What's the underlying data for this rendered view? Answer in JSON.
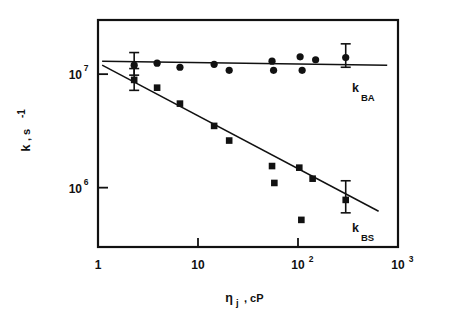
{
  "chart_data": {
    "type": "scatter",
    "title": "",
    "subtitle": "",
    "xlabel": "ηⱼ , cP",
    "xlabel_symbol": "η",
    "xlabel_sub": "j",
    "xlabel_unit": ", cP",
    "ylabel": "k , s  -1",
    "ylabel_symbol": "k",
    "ylabel_unit": ", s",
    "ylabel_exponent": "-1",
    "xscale": "log",
    "yscale": "log",
    "xlim": [
      1,
      1000
    ],
    "ylim": [
      300000,
      30000000
    ],
    "grid": false,
    "legend_position": "inline-right",
    "xticks": [
      {
        "value": 1,
        "label": "1",
        "mantissa": "1",
        "exponent": ""
      },
      {
        "value": 10,
        "label": "10",
        "mantissa": "10",
        "exponent": ""
      },
      {
        "value": 100,
        "label": "10²",
        "mantissa": "10",
        "exponent": "2"
      },
      {
        "value": 1000,
        "label": "10³",
        "mantissa": "10",
        "exponent": "3"
      }
    ],
    "yticks": [
      {
        "value": 10000000,
        "label": "10⁷",
        "mantissa": "10",
        "exponent": "7"
      },
      {
        "value": 1000000,
        "label": "10⁶",
        "mantissa": "10",
        "exponent": "6"
      }
    ],
    "series": [
      {
        "name": "k_BA",
        "label_symbol": "k",
        "label_sub": "BA",
        "marker": "circle",
        "color": "#111111",
        "points": [
          {
            "x": 2.3,
            "y": 12000000
          },
          {
            "x": 3.9,
            "y": 12500000
          },
          {
            "x": 6.6,
            "y": 11500000
          },
          {
            "x": 14.5,
            "y": 12200000
          },
          {
            "x": 20.5,
            "y": 10800000
          },
          {
            "x": 55,
            "y": 13000000
          },
          {
            "x": 57,
            "y": 10800000
          },
          {
            "x": 105,
            "y": 14200000
          },
          {
            "x": 110,
            "y": 10800000
          },
          {
            "x": 150,
            "y": 13400000
          },
          {
            "x": 300,
            "y": 14000000
          }
        ],
        "errorbars": [
          {
            "x": 2.3,
            "y": 12000000,
            "low": 9800000,
            "high": 15500000
          },
          {
            "x": 300,
            "y": 14000000,
            "low": 11500000,
            "high": 18500000
          }
        ],
        "fit": {
          "x1": 1.1,
          "y1": 13000000,
          "x2": 780,
          "y2": 12000000
        }
      },
      {
        "name": "k_BS",
        "label_symbol": "k",
        "label_sub": "BS",
        "marker": "square",
        "color": "#111111",
        "points": [
          {
            "x": 2.3,
            "y": 8900000
          },
          {
            "x": 3.9,
            "y": 7600000
          },
          {
            "x": 6.6,
            "y": 5500000
          },
          {
            "x": 14.5,
            "y": 3500000
          },
          {
            "x": 20.5,
            "y": 2600000
          },
          {
            "x": 55,
            "y": 1550000
          },
          {
            "x": 58,
            "y": 1100000
          },
          {
            "x": 103,
            "y": 1500000
          },
          {
            "x": 108,
            "y": 520000
          },
          {
            "x": 140,
            "y": 1200000
          },
          {
            "x": 300,
            "y": 780000
          }
        ],
        "errorbars": [
          {
            "x": 2.3,
            "y": 8900000,
            "low": 7200000,
            "high": 11200000
          },
          {
            "x": 300,
            "y": 780000,
            "low": 600000,
            "high": 1150000
          }
        ],
        "fit": {
          "x1": 1.1,
          "y1": 12000000,
          "x2": 640,
          "y2": 620000
        }
      }
    ]
  },
  "plot": {
    "frame": {
      "left": 98,
      "top": 20,
      "right": 398,
      "bottom": 247
    }
  }
}
